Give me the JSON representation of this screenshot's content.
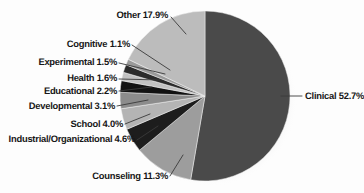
{
  "chart_data": {
    "type": "pie",
    "title": "",
    "subtitle": "",
    "xlabel": "",
    "ylabel": "",
    "legend_position": "none",
    "grid": false,
    "value_unit": "percent",
    "categories": [
      "Clinical",
      "Counseling",
      "Industrial/Organizational",
      "School",
      "Developmental",
      "Educational",
      "Health",
      "Experimental",
      "Cognitive",
      "Other"
    ],
    "values": [
      52.7,
      11.3,
      4.6,
      4.0,
      3.1,
      2.2,
      1.6,
      1.5,
      1.1,
      17.9
    ],
    "slices": [
      {
        "label": "Clinical",
        "value": 52.7,
        "text": "Clinical 52.7%",
        "color": "#4a4a4a"
      },
      {
        "label": "Counseling",
        "value": 11.3,
        "text": "Counseling 11.3%",
        "color": "#9d9d9d"
      },
      {
        "label": "Industrial/Organizational",
        "value": 4.6,
        "text": "Industrial/Organizational 4.6%",
        "color": "#1d1d1d"
      },
      {
        "label": "School",
        "value": 4.0,
        "text": "School 4.0%",
        "color": "#b4b4b4"
      },
      {
        "label": "Developmental",
        "value": 3.1,
        "text": "Developmental 3.1%",
        "color": "#8c8c8c"
      },
      {
        "label": "Educational",
        "value": 2.2,
        "text": "Educational 2.2%",
        "color": "#121212"
      },
      {
        "label": "Health",
        "value": 1.6,
        "text": "Health 1.6%",
        "color": "#c2c2c2"
      },
      {
        "label": "Experimental",
        "value": 1.5,
        "text": "Experimental 1.5%",
        "color": "#2b2b2b"
      },
      {
        "label": "Cognitive",
        "value": 1.1,
        "text": "Cognitive 1.1%",
        "color": "#9a9a9a"
      },
      {
        "label": "Other",
        "value": 17.9,
        "text": "Other 17.9%",
        "color": "#bcbcbc"
      }
    ],
    "total": 100.0
  },
  "labels": {
    "clinical": "Clinical 52.7%",
    "counseling": "Counseling 11.3%",
    "industrial_organizational": "Industrial/Organizational 4.6%",
    "school": "School 4.0%",
    "developmental": "Developmental 3.1%",
    "educational": "Educational 2.2%",
    "health": "Health 1.6%",
    "experimental": "Experimental 1.5%",
    "cognitive": "Cognitive 1.1%",
    "other": "Other 17.9%"
  },
  "style": {
    "background": "#fdfdfd",
    "label_color": "#171717",
    "leader_color": "#3a3a3a",
    "shadow_color": "#d8d8d8"
  }
}
